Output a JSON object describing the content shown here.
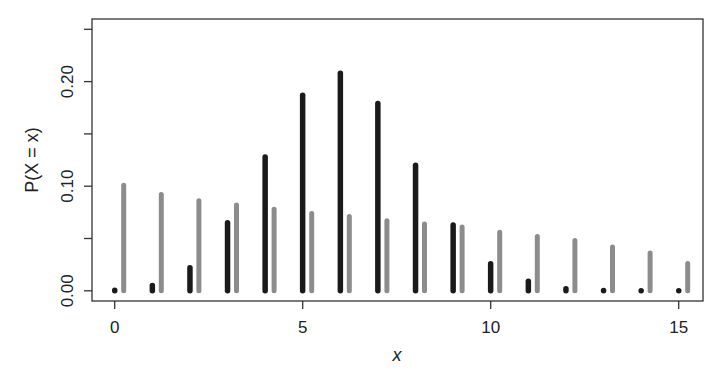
{
  "chart_data": {
    "type": "bar",
    "title": "",
    "xlabel": "x",
    "ylabel": "P(X = x)",
    "x": [
      0,
      1,
      2,
      3,
      4,
      5,
      6,
      7,
      8,
      9,
      10,
      11,
      12,
      13,
      14,
      15
    ],
    "series": [
      {
        "name": "black",
        "color": "#1a1a1a",
        "values": [
          0.0005,
          0.005,
          0.022,
          0.065,
          0.128,
          0.187,
          0.208,
          0.179,
          0.12,
          0.063,
          0.026,
          0.009,
          0.002,
          0.0003,
          0.0,
          0.0
        ]
      },
      {
        "name": "gray",
        "color": "#8c8c8c",
        "values": [
          0.101,
          0.092,
          0.086,
          0.082,
          0.078,
          0.074,
          0.071,
          0.067,
          0.064,
          0.061,
          0.056,
          0.052,
          0.048,
          0.042,
          0.036,
          0.026
        ]
      }
    ],
    "xlim": [
      -0.5,
      15.5
    ],
    "ylim": [
      0.0,
      0.26
    ],
    "xticks": [
      0,
      5,
      10,
      15
    ],
    "xtick_labels": [
      "0",
      "5",
      "10",
      "15"
    ],
    "yticks": [
      0.0,
      0.05,
      0.1,
      0.15,
      0.2,
      0.25
    ],
    "ytick_labels": [
      "0.00",
      "",
      "0.10",
      "",
      "0.20",
      ""
    ],
    "grid": false,
    "legend": "none"
  }
}
